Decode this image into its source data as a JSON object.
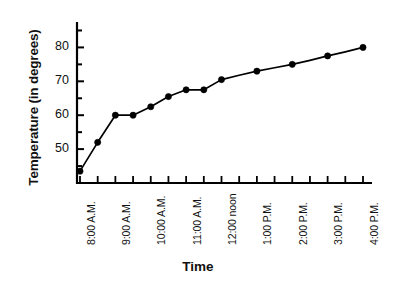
{
  "chart_data": {
    "type": "line",
    "title": "",
    "xlabel": "Time",
    "ylabel": "Temperature (in degrees)",
    "grid": false,
    "legend": "none",
    "marker": "filled-circle",
    "line_color": "#000000",
    "marker_color": "#000000",
    "axis_color": "#000000",
    "background": "#ffffff",
    "ylim": [
      40,
      87.5
    ],
    "ytick_labels": [
      "50",
      "60",
      "70",
      "80"
    ],
    "ytick_values": [
      50,
      60,
      70,
      80
    ],
    "yminor_step": 5,
    "categories": [
      "8:00 A.M.",
      "",
      "9:00 A.M.",
      "",
      "10:00 A.M.",
      "",
      "11:00 A.M.",
      "",
      "12:00 noon",
      "",
      "1:00 P.M.",
      "",
      "2:00 P.M.",
      "",
      "3:00 P.M.",
      "",
      "4:00 P.M."
    ],
    "xtick_labels": [
      "8:00 A.M.",
      "9:00 A.M.",
      "10:00 A.M.",
      "11:00 A.M.",
      "12:00 noon",
      "1:00 P.M.",
      "2:00 P.M.",
      "3:00 P.M.",
      "4:00 P.M."
    ],
    "values": [
      43.5,
      52,
      60,
      60,
      62.5,
      65.5,
      67.5,
      67.5,
      70.5,
      71.8,
      73,
      74,
      75,
      76.2,
      77.5,
      78.7,
      80
    ],
    "points": [
      {
        "x": "8:00 A.M.",
        "y": 43.5,
        "marker": true
      },
      {
        "x": "8:30 A.M.",
        "y": 52,
        "marker": true
      },
      {
        "x": "9:00 A.M.",
        "y": 60,
        "marker": true
      },
      {
        "x": "9:30 A.M.",
        "y": 60,
        "marker": true
      },
      {
        "x": "10:00 A.M.",
        "y": 62.5,
        "marker": true
      },
      {
        "x": "10:30 A.M.",
        "y": 65.5,
        "marker": true
      },
      {
        "x": "11:00 A.M.",
        "y": 67.5,
        "marker": true
      },
      {
        "x": "11:30 A.M.",
        "y": 67.5,
        "marker": true
      },
      {
        "x": "12:00 noon",
        "y": 70.5,
        "marker": true
      },
      {
        "x": "12:30 P.M.",
        "y": 71.8,
        "marker": false
      },
      {
        "x": "1:00 P.M.",
        "y": 73,
        "marker": true
      },
      {
        "x": "1:30 P.M.",
        "y": 74,
        "marker": false
      },
      {
        "x": "2:00 P.M.",
        "y": 75,
        "marker": true
      },
      {
        "x": "2:30 P.M.",
        "y": 76.2,
        "marker": false
      },
      {
        "x": "3:00 P.M.",
        "y": 77.5,
        "marker": true
      },
      {
        "x": "3:30 P.M.",
        "y": 78.7,
        "marker": false
      },
      {
        "x": "4:00 P.M.",
        "y": 80,
        "marker": true
      }
    ]
  }
}
